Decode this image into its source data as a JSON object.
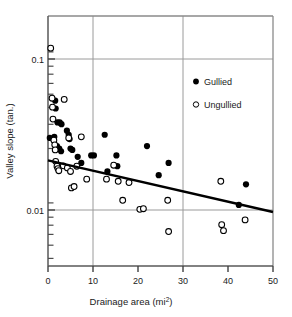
{
  "chart_data": {
    "type": "scatter",
    "title": "",
    "xlabel": "Drainage area (mi2)",
    "xlabel_main": "Drainage area (mi",
    "xlabel_sup": "2",
    "xlabel_tail": ")",
    "ylabel": "Valley slope (tan.)",
    "xlim": [
      0,
      50
    ],
    "ylim": [
      0.004,
      0.18
    ],
    "yscale": "log",
    "xscale": "linear",
    "grid": "major gridlines at x=10,30 and y=0.1,0.01",
    "xticks": [
      0,
      10,
      20,
      30,
      40,
      50
    ],
    "xtick_labels": [
      "0",
      "10",
      "20",
      "30",
      "40",
      "50"
    ],
    "yticks": [
      0.1,
      0.01
    ],
    "ytick_labels": [
      "0.1",
      "0.01"
    ],
    "yminor_ticks": [
      0.09,
      0.08,
      0.07,
      0.06,
      0.05,
      0.04,
      0.03,
      0.02,
      0.009,
      0.008,
      0.007,
      0.006,
      0.005
    ],
    "legend_position": "upper right inside plot",
    "series": [
      {
        "name": "Gullied",
        "marker": "filled-circle",
        "color": "#000000",
        "points": [
          [
            0.4,
            0.03
          ],
          [
            1.6,
            0.053
          ],
          [
            1.7,
            0.047
          ],
          [
            2.1,
            0.038
          ],
          [
            2.6,
            0.038
          ],
          [
            3.0,
            0.037
          ],
          [
            1.4,
            0.0305
          ],
          [
            2.0,
            0.0265
          ],
          [
            2.5,
            0.0255
          ],
          [
            2.9,
            0.0245
          ],
          [
            4.2,
            0.0335
          ],
          [
            4.6,
            0.0315
          ],
          [
            4.8,
            0.0295
          ],
          [
            5.0,
            0.0255
          ],
          [
            5.4,
            0.025
          ],
          [
            6.6,
            0.0225
          ],
          [
            7.4,
            0.0205
          ],
          [
            9.6,
            0.023
          ],
          [
            10.2,
            0.023
          ],
          [
            12.6,
            0.0315
          ],
          [
            13.2,
            0.018
          ],
          [
            15.2,
            0.023
          ],
          [
            15.4,
            0.0195
          ],
          [
            22.0,
            0.0265
          ],
          [
            24.6,
            0.017
          ],
          [
            26.8,
            0.0205
          ],
          [
            42.4,
            0.0108
          ],
          [
            44.0,
            0.0148
          ]
        ]
      },
      {
        "name": "Ungullied",
        "marker": "open-circle",
        "color": "#000000",
        "points": [
          [
            0.6,
            0.118
          ],
          [
            0.9,
            0.055
          ],
          [
            1.0,
            0.048
          ],
          [
            1.1,
            0.04
          ],
          [
            1.3,
            0.029
          ],
          [
            1.5,
            0.027
          ],
          [
            1.6,
            0.025
          ],
          [
            3.6,
            0.054
          ],
          [
            4.6,
            0.03
          ],
          [
            7.4,
            0.0305
          ],
          [
            1.7,
            0.021
          ],
          [
            2.0,
            0.0195
          ],
          [
            2.2,
            0.0188
          ],
          [
            2.4,
            0.0182
          ],
          [
            3.4,
            0.0196
          ],
          [
            4.3,
            0.019
          ],
          [
            5.0,
            0.018
          ],
          [
            5.2,
            0.014
          ],
          [
            5.8,
            0.0143
          ],
          [
            6.4,
            0.0195
          ],
          [
            8.6,
            0.016
          ],
          [
            13.0,
            0.016
          ],
          [
            14.6,
            0.0198
          ],
          [
            15.6,
            0.0155
          ],
          [
            18.0,
            0.0152
          ],
          [
            16.6,
            0.0116
          ],
          [
            20.4,
            0.0101
          ],
          [
            21.2,
            0.0102
          ],
          [
            26.6,
            0.0116
          ],
          [
            26.8,
            0.0072
          ],
          [
            38.6,
            0.008
          ],
          [
            39.0,
            0.0073
          ],
          [
            38.4,
            0.0155
          ],
          [
            43.8,
            0.0086
          ]
        ]
      }
    ],
    "trendline": {
      "name": "regression line",
      "x_start": 0,
      "y_start": 0.0213,
      "x_end": 50,
      "y_end": 0.0097
    },
    "legend": [
      {
        "label": "Gullied",
        "marker": "filled-circle"
      },
      {
        "label": "Ungullied",
        "marker": "open-circle"
      }
    ],
    "colors": {
      "frame": "#808080",
      "gridline": "#9a9a9a",
      "marker": "#000000",
      "trendline": "#000000",
      "text": "#1a1a1a",
      "background": "#ffffff"
    }
  }
}
